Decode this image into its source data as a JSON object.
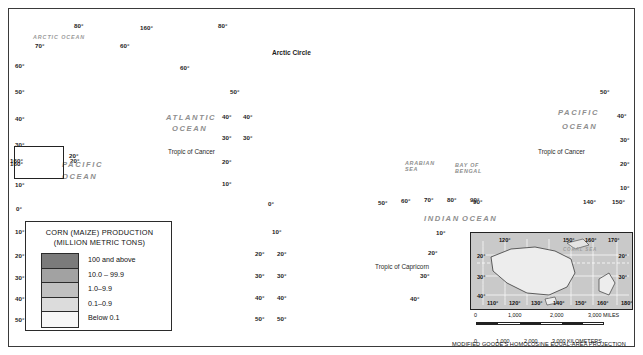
{
  "map": {
    "projection_note": "MODIFIED GOODE'S HOMOLOSINE EQUAL-AREA PROJECTION",
    "legend": {
      "title_line1": "CORN (MAIZE) PRODUCTION",
      "title_line2": "(MILLION METRIC TONS)",
      "classes": [
        {
          "label": "100 and above",
          "color": "#7b7b7b"
        },
        {
          "label": "10.0 – 99.9",
          "color": "#a2a2a2"
        },
        {
          "label": "1.0–9.9",
          "color": "#c0c0c0"
        },
        {
          "label": "0.1–0.9",
          "color": "#dcdcdc"
        },
        {
          "label": "Below 0.1",
          "color": "#f7f7f7"
        }
      ]
    },
    "ocean_labels": [
      {
        "name": "ARCTIC OCEAN",
        "x": 33,
        "y": 34
      },
      {
        "name": "ATLANTIC",
        "x": 166,
        "y": 113
      },
      {
        "name": "OCEAN",
        "x": 172,
        "y": 124
      },
      {
        "name": "PACIFIC",
        "x": 62,
        "y": 160
      },
      {
        "name": "OCEAN",
        "x": 62,
        "y": 172
      },
      {
        "name": "PACIFIC",
        "x": 558,
        "y": 108
      },
      {
        "name": "OCEAN",
        "x": 562,
        "y": 122
      },
      {
        "name": "INDIAN",
        "x": 424,
        "y": 214
      },
      {
        "name": "OCEAN",
        "x": 462,
        "y": 214
      },
      {
        "name": "ARABIAN SEA",
        "x": 405,
        "y": 160
      },
      {
        "name": "BAY OF BENGAL",
        "x": 455,
        "y": 162
      },
      {
        "name": "CORAL SEA",
        "x": 567,
        "y": 243
      }
    ],
    "line_labels": [
      {
        "name": "Arctic Circle",
        "x": 272,
        "y": 49
      },
      {
        "name": "Tropic of Cancer",
        "x": 168,
        "y": 148
      },
      {
        "name": "Tropic of Cancer",
        "x": 538,
        "y": 148
      },
      {
        "name": "Tropic of Capricorn",
        "x": 375,
        "y": 263
      }
    ],
    "graticule_labels": [
      {
        "t": "80°",
        "x": 74,
        "y": 22
      },
      {
        "t": "70°",
        "x": 35,
        "y": 42
      },
      {
        "t": "60°",
        "x": 15,
        "y": 62
      },
      {
        "t": "50°",
        "x": 15,
        "y": 88
      },
      {
        "t": "40°",
        "x": 15,
        "y": 115
      },
      {
        "t": "30°",
        "x": 15,
        "y": 141
      },
      {
        "t": "20°",
        "x": 70,
        "y": 157
      },
      {
        "t": "160°",
        "x": 10,
        "y": 160
      },
      {
        "t": "10°",
        "x": 15,
        "y": 181
      },
      {
        "t": "0°",
        "x": 16,
        "y": 205
      },
      {
        "t": "10°",
        "x": 15,
        "y": 228
      },
      {
        "t": "20°",
        "x": 15,
        "y": 252
      },
      {
        "t": "30°",
        "x": 15,
        "y": 274
      },
      {
        "t": "40°",
        "x": 15,
        "y": 295
      },
      {
        "t": "50°",
        "x": 15,
        "y": 316
      },
      {
        "t": "60°",
        "x": 180,
        "y": 64
      },
      {
        "t": "80°",
        "x": 218,
        "y": 22
      },
      {
        "t": "50°",
        "x": 230,
        "y": 88
      },
      {
        "t": "40°",
        "x": 222,
        "y": 113
      },
      {
        "t": "40°",
        "x": 243,
        "y": 113
      },
      {
        "t": "30°",
        "x": 222,
        "y": 134
      },
      {
        "t": "30°",
        "x": 243,
        "y": 134
      },
      {
        "t": "20°",
        "x": 222,
        "y": 158
      },
      {
        "t": "10°",
        "x": 222,
        "y": 180
      },
      {
        "t": "0°",
        "x": 268,
        "y": 200
      },
      {
        "t": "10°",
        "x": 272,
        "y": 228
      },
      {
        "t": "20°",
        "x": 255,
        "y": 250
      },
      {
        "t": "20°",
        "x": 277,
        "y": 250
      },
      {
        "t": "30°",
        "x": 255,
        "y": 272
      },
      {
        "t": "30°",
        "x": 277,
        "y": 272
      },
      {
        "t": "40°",
        "x": 255,
        "y": 294
      },
      {
        "t": "40°",
        "x": 277,
        "y": 294
      },
      {
        "t": "50°",
        "x": 255,
        "y": 315
      },
      {
        "t": "50°",
        "x": 277,
        "y": 315
      },
      {
        "t": "50°",
        "x": 378,
        "y": 199
      },
      {
        "t": "60°",
        "x": 401,
        "y": 197
      },
      {
        "t": "70°",
        "x": 424,
        "y": 196
      },
      {
        "t": "80°",
        "x": 447,
        "y": 196
      },
      {
        "t": "90°",
        "x": 470,
        "y": 196
      },
      {
        "t": "10°",
        "x": 436,
        "y": 229
      },
      {
        "t": "20°",
        "x": 428,
        "y": 249
      },
      {
        "t": "30°",
        "x": 420,
        "y": 272
      },
      {
        "t": "40°",
        "x": 410,
        "y": 295
      },
      {
        "t": "90°",
        "x": 473,
        "y": 198
      },
      {
        "t": "140°",
        "x": 583,
        "y": 198
      },
      {
        "t": "150°",
        "x": 612,
        "y": 198
      },
      {
        "t": "50°",
        "x": 600,
        "y": 88
      },
      {
        "t": "40°",
        "x": 617,
        "y": 112
      },
      {
        "t": "30°",
        "x": 620,
        "y": 136
      },
      {
        "t": "20°",
        "x": 620,
        "y": 160
      },
      {
        "t": "10°",
        "x": 620,
        "y": 184
      },
      {
        "t": "160°",
        "x": 140,
        "y": 24
      },
      {
        "t": "60°",
        "x": 120,
        "y": 42
      }
    ],
    "hawaii_inset": {
      "lon": "160°",
      "lat": "20°"
    },
    "australia_inset": {
      "top_labels": [
        {
          "t": "120°",
          "x": 28
        },
        {
          "t": "150°",
          "x": 92
        },
        {
          "t": "160°",
          "x": 114
        },
        {
          "t": "170°",
          "x": 137
        }
      ],
      "bottom_labels": [
        {
          "t": "110°",
          "x": 16
        },
        {
          "t": "120°",
          "x": 38
        },
        {
          "t": "130°",
          "x": 60
        },
        {
          "t": "140°",
          "x": 82
        },
        {
          "t": "150°",
          "x": 104
        },
        {
          "t": "160°",
          "x": 126
        },
        {
          "t": "180°",
          "x": 150
        }
      ],
      "left_labels": [
        {
          "t": "20°",
          "y": 20
        },
        {
          "t": "30°",
          "y": 41
        },
        {
          "t": "40°",
          "y": 60
        }
      ],
      "right_labels": [
        {
          "t": "20°",
          "y": 20
        },
        {
          "t": "30°",
          "y": 41
        }
      ],
      "sea_label": "CORAL SEA"
    },
    "scale": {
      "miles_ticks": [
        "0",
        "1,000",
        "2,000",
        "3,000 MILES"
      ],
      "km_ticks": [
        "0",
        "1,000",
        "2,000",
        "3,000 KILOMETERS"
      ]
    }
  },
  "chart_data": {
    "type": "map",
    "title": "CORN (MAIZE) PRODUCTION (MILLION METRIC TONS)",
    "classes": [
      "100 and above",
      "10.0 – 99.9",
      "1.0–9.9",
      "0.1–0.9",
      "Below 0.1"
    ],
    "class_colors": [
      "#7b7b7b",
      "#a2a2a2",
      "#c0c0c0",
      "#dcdcdc",
      "#f7f7f7"
    ],
    "regions": [
      {
        "name": "United States",
        "class": "100 and above"
      },
      {
        "name": "China",
        "class": "100 and above"
      },
      {
        "name": "Brazil",
        "class": "100 and above"
      },
      {
        "name": "Argentina",
        "class": "10.0 – 99.9"
      },
      {
        "name": "Mexico",
        "class": "10.0 – 99.9"
      },
      {
        "name": "Canada",
        "class": "10.0 – 99.9"
      },
      {
        "name": "India",
        "class": "10.0 – 99.9"
      },
      {
        "name": "Russia",
        "class": "10.0 – 99.9"
      },
      {
        "name": "Ukraine",
        "class": "10.0 – 99.9"
      },
      {
        "name": "South Africa",
        "class": "10.0 – 99.9"
      },
      {
        "name": "Indonesia",
        "class": "10.0 – 99.9"
      },
      {
        "name": "France",
        "class": "10.0 – 99.9"
      },
      {
        "name": "Australia",
        "class": "0.1–0.9"
      },
      {
        "name": "Greenland",
        "class": "Below 0.1"
      },
      {
        "name": "Sahara states",
        "class": "Below 0.1"
      }
    ]
  }
}
